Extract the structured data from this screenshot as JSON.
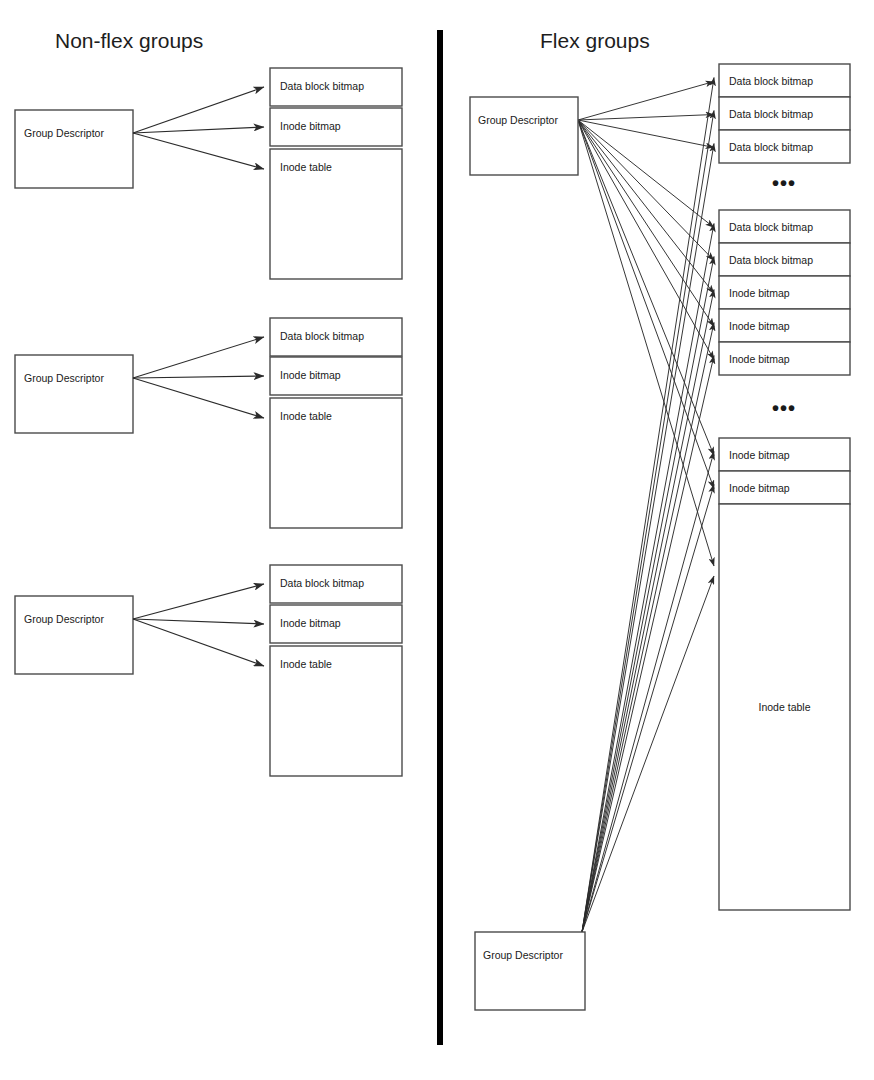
{
  "page": {
    "width": 874,
    "height": 1080,
    "background": "#ffffff",
    "ink": "#1a1a1a"
  },
  "panels": {
    "left": {
      "title": "Non-flex groups",
      "title_x": 55,
      "title_y": 48,
      "groups": [
        {
          "descriptor": {
            "label": "Group Descriptor",
            "x": 15,
            "y": 110,
            "w": 118,
            "h": 78
          },
          "blocks": [
            {
              "label": "Data block bitmap",
              "x": 270,
              "y": 68,
              "w": 132,
              "h": 38
            },
            {
              "label": "Inode bitmap",
              "x": 270,
              "y": 108,
              "w": 132,
              "h": 38
            },
            {
              "label": "Inode table",
              "x": 270,
              "y": 149,
              "w": 132,
              "h": 130
            }
          ]
        },
        {
          "descriptor": {
            "label": "Group Descriptor",
            "x": 15,
            "y": 355,
            "w": 118,
            "h": 78
          },
          "blocks": [
            {
              "label": "Data block bitmap",
              "x": 270,
              "y": 318,
              "w": 132,
              "h": 38
            },
            {
              "label": "Inode bitmap",
              "x": 270,
              "y": 357,
              "w": 132,
              "h": 38
            },
            {
              "label": "Inode table",
              "x": 270,
              "y": 398,
              "w": 132,
              "h": 130
            }
          ]
        },
        {
          "descriptor": {
            "label": "Group Descriptor",
            "x": 15,
            "y": 596,
            "w": 118,
            "h": 78
          },
          "blocks": [
            {
              "label": "Data block bitmap",
              "x": 270,
              "y": 565,
              "w": 132,
              "h": 38
            },
            {
              "label": "Inode bitmap",
              "x": 270,
              "y": 605,
              "w": 132,
              "h": 38
            },
            {
              "label": "Inode table",
              "x": 270,
              "y": 646,
              "w": 132,
              "h": 130
            }
          ]
        }
      ]
    },
    "right": {
      "title": "Flex groups",
      "title_x": 540,
      "title_y": 48,
      "descriptors": [
        {
          "label": "Group Descriptor",
          "x": 470,
          "y": 97,
          "w": 108,
          "h": 78,
          "origin_x": 578,
          "origin_y": 120
        },
        {
          "label": "Group Descriptor",
          "x": 475,
          "y": 932,
          "w": 110,
          "h": 78,
          "origin_x": 585,
          "origin_y": 932
        }
      ],
      "block_clusters": [
        {
          "blocks": [
            {
              "label": "Data block bitmap",
              "x": 719,
              "y": 64,
              "w": 131,
              "h": 33
            },
            {
              "label": "Data block bitmap",
              "x": 719,
              "y": 97,
              "w": 131,
              "h": 33
            },
            {
              "label": "Data block bitmap",
              "x": 719,
              "y": 130,
              "w": 131,
              "h": 33
            }
          ]
        },
        {
          "blocks": [
            {
              "label": "Data block bitmap",
              "x": 719,
              "y": 210,
              "w": 131,
              "h": 33
            },
            {
              "label": "Data block bitmap",
              "x": 719,
              "y": 243,
              "w": 131,
              "h": 33
            },
            {
              "label": "Inode bitmap",
              "x": 719,
              "y": 276,
              "w": 131,
              "h": 33
            },
            {
              "label": "Inode bitmap",
              "x": 719,
              "y": 309,
              "w": 131,
              "h": 33
            },
            {
              "label": "Inode bitmap",
              "x": 719,
              "y": 342,
              "w": 131,
              "h": 33
            }
          ]
        },
        {
          "blocks": [
            {
              "label": "Inode bitmap",
              "x": 719,
              "y": 438,
              "w": 131,
              "h": 33
            },
            {
              "label": "Inode bitmap",
              "x": 719,
              "y": 471,
              "w": 131,
              "h": 33
            },
            {
              "label": "Inode table",
              "x": 719,
              "y": 504,
              "w": 131,
              "h": 406
            }
          ]
        }
      ],
      "ellipses": [
        {
          "text": "•••",
          "x": 784,
          "y": 190
        },
        {
          "text": "•••",
          "x": 784,
          "y": 415
        }
      ]
    }
  },
  "divider": {
    "x": 440,
    "y1": 30,
    "y2": 1045,
    "color": "#000000"
  },
  "legend_notes": {
    "block_kinds": [
      "Data block bitmap",
      "Inode bitmap",
      "Inode table"
    ],
    "descriptor_kind": "Group Descriptor"
  }
}
